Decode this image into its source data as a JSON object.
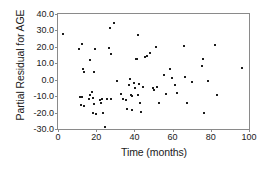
{
  "chart_data": {
    "type": "scatter",
    "title": "",
    "xlabel": "Time (months)",
    "ylabel": "Partial Residual for AGE",
    "xlim": [
      0,
      100
    ],
    "ylim": [
      -30.0,
      40.0
    ],
    "xticks": [
      0,
      20,
      40,
      60,
      80,
      100
    ],
    "xticklabels": [
      "0",
      "20",
      "40",
      "60",
      "80",
      "100"
    ],
    "yticks": [
      40.0,
      30.0,
      20.0,
      10.0,
      0.0,
      -10.0,
      -20.0,
      -30.0
    ],
    "yticklabels": [
      "40.0",
      "30.0",
      "20.0",
      "10.0",
      "0.0",
      "-10.0",
      "-20.0",
      "-30.0"
    ],
    "grid": false,
    "legend": null,
    "marker": "square",
    "marker_color": "#1c1c1c",
    "frame_color": "#8a8a8a",
    "points": [
      [
        2.5,
        28.0
      ],
      [
        11.0,
        18.5
      ],
      [
        12.5,
        21.5
      ],
      [
        13.0,
        6.5
      ],
      [
        13.5,
        4.5
      ],
      [
        11.5,
        -10.5
      ],
      [
        12.5,
        -10.5
      ],
      [
        12.0,
        -15.5
      ],
      [
        13.5,
        -16.0
      ],
      [
        16.5,
        12.0
      ],
      [
        17.0,
        -9.0
      ],
      [
        16.0,
        -11.5
      ],
      [
        18.5,
        -11.0
      ],
      [
        19.5,
        19.0
      ],
      [
        19.0,
        5.0
      ],
      [
        18.0,
        -7.5
      ],
      [
        19.0,
        -14.5
      ],
      [
        18.5,
        -20.5
      ],
      [
        20.0,
        -21.0
      ],
      [
        22.0,
        -12.5
      ],
      [
        22.5,
        -14.0
      ],
      [
        23.0,
        -11.5
      ],
      [
        23.5,
        -20.5
      ],
      [
        24.5,
        -29.0
      ],
      [
        25.5,
        -12.0
      ],
      [
        26.5,
        19.5
      ],
      [
        27.0,
        31.5
      ],
      [
        27.5,
        15.5
      ],
      [
        28.0,
        -12.0
      ],
      [
        29.5,
        34.5
      ],
      [
        31.0,
        -1.0
      ],
      [
        33.0,
        -8.5
      ],
      [
        34.0,
        -12.0
      ],
      [
        35.5,
        -12.5
      ],
      [
        36.0,
        -18.0
      ],
      [
        37.5,
        0.5
      ],
      [
        37.0,
        -3.5
      ],
      [
        38.0,
        -9.5
      ],
      [
        38.5,
        -10.0
      ],
      [
        38.5,
        -18.5
      ],
      [
        40.0,
        -2.0
      ],
      [
        40.5,
        -5.0
      ],
      [
        41.0,
        12.5
      ],
      [
        41.5,
        12.5
      ],
      [
        42.0,
        27.0
      ],
      [
        42.5,
        -2.5
      ],
      [
        42.0,
        -9.0
      ],
      [
        43.0,
        -14.0
      ],
      [
        43.5,
        -19.5
      ],
      [
        44.5,
        -4.5
      ],
      [
        45.5,
        14.0
      ],
      [
        46.5,
        14.5
      ],
      [
        48.0,
        16.0
      ],
      [
        49.5,
        -5.0
      ],
      [
        50.5,
        -6.5
      ],
      [
        51.5,
        20.0
      ],
      [
        52.0,
        -4.5
      ],
      [
        53.0,
        -14.0
      ],
      [
        55.5,
        3.0
      ],
      [
        56.5,
        -8.5
      ],
      [
        58.5,
        6.5
      ],
      [
        59.5,
        1.0
      ],
      [
        61.5,
        -3.5
      ],
      [
        62.5,
        -8.0
      ],
      [
        66.0,
        20.5
      ],
      [
        66.5,
        1.5
      ],
      [
        67.5,
        -14.0
      ],
      [
        70.0,
        -1.5
      ],
      [
        75.5,
        8.5
      ],
      [
        76.0,
        12.5
      ],
      [
        76.5,
        -20.0
      ],
      [
        78.5,
        -1.0
      ],
      [
        82.0,
        21.0
      ],
      [
        83.0,
        -9.0
      ],
      [
        96.5,
        7.0
      ]
    ]
  }
}
